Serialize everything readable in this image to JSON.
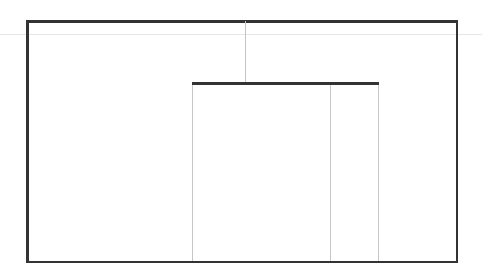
{
  "drawing": {
    "title": "Technical line drawing",
    "background_color": "#ffffff",
    "heavy_line_color": "#333333",
    "light_line_color": "#c6c6c6",
    "faint_line_color": "#e6e6e6",
    "canvas": {
      "width": 482,
      "height": 280
    },
    "elements": {
      "outer_frame": {
        "name": "outer-rectangle",
        "x": 26,
        "y": 20,
        "width": 432,
        "height": 243,
        "stroke": "#333333",
        "stroke_width": 2.5
      },
      "guide_line": {
        "name": "horizontal-guide-line",
        "x": 0,
        "y": 34,
        "width": 482,
        "stroke": "#e6e6e6",
        "stroke_width": 1
      },
      "drop_line": {
        "name": "vertical-drop-line",
        "x": 245,
        "y": 21,
        "height": 62,
        "stroke": "#c4c4c4",
        "stroke_width": 1.2
      },
      "inner_bar": {
        "name": "inner-horizontal-bar",
        "x": 192,
        "y": 82,
        "width": 187,
        "stroke": "#333333",
        "stroke_width": 2.5
      },
      "posts": [
        {
          "name": "post-left",
          "x": 192,
          "y": 85,
          "height": 176,
          "stroke": "#c6c6c6"
        },
        {
          "name": "post-mid",
          "x": 329.5,
          "y": 85,
          "height": 176,
          "stroke": "#c6c6c6"
        },
        {
          "name": "post-right",
          "x": 377.5,
          "y": 85,
          "height": 176,
          "stroke": "#c6c6c6"
        }
      ]
    }
  }
}
